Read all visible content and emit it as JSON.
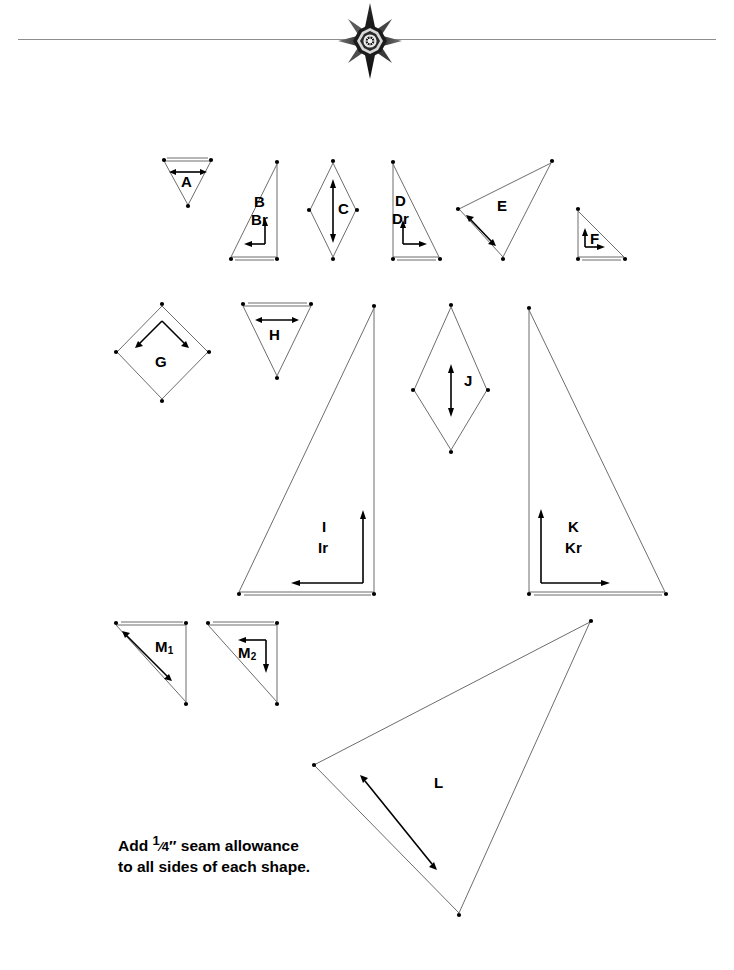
{
  "page": {
    "background_color": "#ffffff",
    "rule_color": "#8e8e8e",
    "outline_color": "#6d6d6d",
    "arrow_color": "#000000"
  },
  "header": {
    "ornament_name": "eight-pointed-star-ornament",
    "has_horizontal_rule": true
  },
  "caption": {
    "line1_prefix": "Add ",
    "fraction": "1/4",
    "line1_suffix": "″ seam allowance",
    "line2": "to all sides of each shape."
  },
  "shapes": [
    {
      "id": "A",
      "label": "A",
      "sub": "",
      "label2": "",
      "type": "triangle",
      "row": 1
    },
    {
      "id": "B",
      "label": "B",
      "sub": "",
      "label2": "Br",
      "type": "right-triangle",
      "row": 1
    },
    {
      "id": "C",
      "label": "C",
      "sub": "",
      "label2": "",
      "type": "diamond",
      "row": 1
    },
    {
      "id": "D",
      "label": "D",
      "sub": "",
      "label2": "Dr",
      "type": "right-triangle",
      "row": 1
    },
    {
      "id": "E",
      "label": "E",
      "sub": "",
      "label2": "",
      "type": "triangle",
      "row": 1
    },
    {
      "id": "F",
      "label": "F",
      "sub": "",
      "label2": "",
      "type": "right-triangle",
      "row": 1
    },
    {
      "id": "G",
      "label": "G",
      "sub": "",
      "label2": "",
      "type": "square",
      "row": 2
    },
    {
      "id": "H",
      "label": "H",
      "sub": "",
      "label2": "",
      "type": "triangle",
      "row": 2
    },
    {
      "id": "I",
      "label": "I",
      "sub": "",
      "label2": "Ir",
      "type": "right-triangle",
      "row": 2
    },
    {
      "id": "J",
      "label": "J",
      "sub": "",
      "label2": "",
      "type": "diamond",
      "row": 2
    },
    {
      "id": "K",
      "label": "K",
      "sub": "",
      "label2": "Kr",
      "type": "right-triangle",
      "row": 2
    },
    {
      "id": "M1",
      "label": "M",
      "sub": "1",
      "label2": "",
      "type": "right-triangle",
      "row": 3
    },
    {
      "id": "M2",
      "label": "M",
      "sub": "2",
      "label2": "",
      "type": "right-triangle",
      "row": 3
    },
    {
      "id": "L",
      "label": "L",
      "sub": "",
      "label2": "",
      "type": "triangle",
      "row": 3
    }
  ],
  "labels": {
    "A": "A",
    "B": "B",
    "Br": "Br",
    "C": "C",
    "D": "D",
    "Dr": "Dr",
    "E": "E",
    "F": "F",
    "G": "G",
    "H": "H",
    "I": "I",
    "Ir": "Ir",
    "J": "J",
    "K": "K",
    "Kr": "Kr",
    "L": "L",
    "M": "M",
    "M1_sub": "1",
    "M2_sub": "2"
  }
}
